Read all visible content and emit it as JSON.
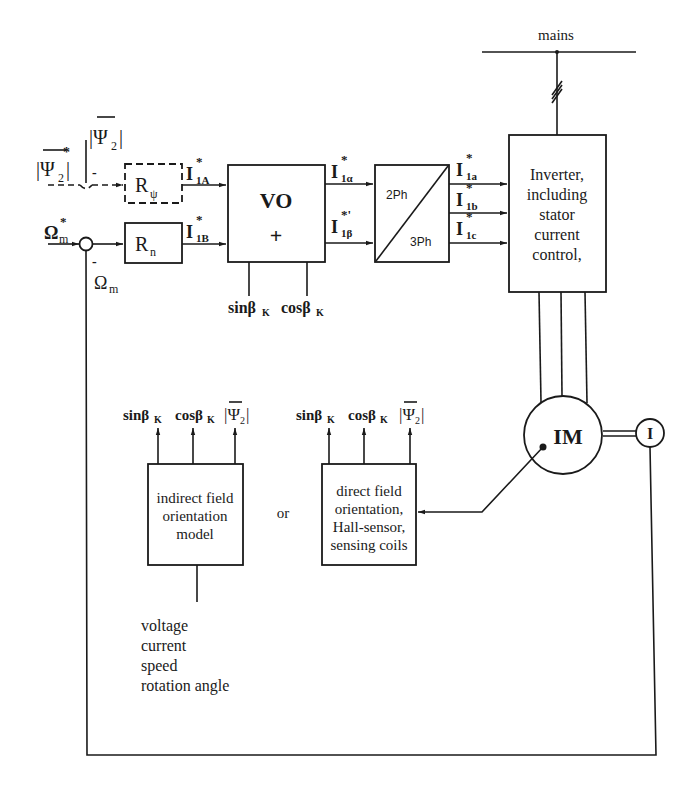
{
  "mains": {
    "label": "mains"
  },
  "inputs": {
    "flux_ref": "|Ψ₂|*",
    "flux_ref_base": "|Ψ",
    "flux_ref_sub": "2",
    "flux_ref_sup": "*",
    "flux_fb_base": "|Ψ",
    "flux_fb_sub": "2",
    "flux_fb_close": "|",
    "flux_fb_sign": "-",
    "speed_ref_base": "Ω",
    "speed_ref_sub": "m",
    "speed_ref_sup": "*",
    "speed_fb_base": "Ω",
    "speed_fb_sub": "m",
    "speed_fb_sign": "-"
  },
  "blocks": {
    "r_psi": {
      "base": "R",
      "sub": "ψ"
    },
    "r_n": {
      "base": "R",
      "sub": "n"
    },
    "vo": {
      "line1": "VO",
      "line2": "+"
    },
    "transform": {
      "top": "2Ph",
      "bottom": "3Ph"
    },
    "inverter": {
      "lines": [
        "Inverter,",
        "including",
        "stator",
        "current",
        "control,"
      ]
    },
    "motor": {
      "label": "IM"
    },
    "encoder": {
      "label": "I"
    },
    "indirect": {
      "lines": [
        "indirect field",
        "orientation",
        "model"
      ]
    },
    "direct": {
      "lines": [
        "direct field",
        "orientation,",
        "Hall-sensor,",
        "sensing coils"
      ]
    },
    "or_label": "or"
  },
  "signals": {
    "i1A": {
      "base": "I",
      "sub": "1A",
      "sup": "*"
    },
    "i1B": {
      "base": "I",
      "sub": "1B",
      "sup": "*"
    },
    "i1alpha": {
      "base": "I",
      "sub": "1α",
      "sup": "*"
    },
    "i1beta": {
      "base": "I",
      "sub": "1β",
      "sup": "*'"
    },
    "i1a": {
      "base": "I",
      "sub": "1a",
      "sup": "*"
    },
    "i1b": {
      "base": "I",
      "sub": "1b",
      "sup": "*"
    },
    "i1c": {
      "base": "I",
      "sub": "1c",
      "sup": "*"
    },
    "vo_sin": "sinβ",
    "vo_cos": "cosβ",
    "k_sub": "K",
    "psi_out_base": "|Ψ",
    "psi_out_sub": "2",
    "psi_out_close": "|"
  },
  "indirect_inputs": [
    "voltage",
    "current",
    "speed",
    "rotation angle"
  ]
}
